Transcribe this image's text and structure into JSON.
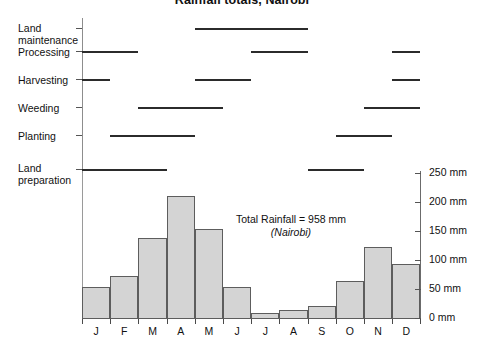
{
  "figure": {
    "title": "Rainfall totals, Nairobi"
  },
  "gantt": {
    "tasks": [
      {
        "label": "Land\nmaintenance",
        "periods": [
          {
            "start_month": 5,
            "end_month": 8
          }
        ]
      },
      {
        "label": "Processing",
        "periods": [
          {
            "start_month": 1,
            "end_month": 2
          },
          {
            "start_month": 7,
            "end_month": 8
          },
          {
            "start_month": 12,
            "end_month": 12
          }
        ]
      },
      {
        "label": "Harvesting",
        "periods": [
          {
            "start_month": 1,
            "end_month": 1
          },
          {
            "start_month": 5,
            "end_month": 6
          },
          {
            "start_month": 12,
            "end_month": 12
          }
        ]
      },
      {
        "label": "Weeding",
        "periods": [
          {
            "start_month": 3,
            "end_month": 5
          },
          {
            "start_month": 11,
            "end_month": 12
          }
        ]
      },
      {
        "label": "Planting",
        "periods": [
          {
            "start_month": 2,
            "end_month": 4
          },
          {
            "start_month": 10,
            "end_month": 11
          }
        ]
      },
      {
        "label": "Land\npreparation",
        "periods": [
          {
            "start_month": 1,
            "end_month": 3
          },
          {
            "start_month": 9,
            "end_month": 10
          }
        ]
      }
    ]
  },
  "chart_data": {
    "type": "bar",
    "title": "Rainfall totals, Nairobi",
    "xlabel": "",
    "ylabel": "",
    "categories": [
      "J",
      "F",
      "M",
      "A",
      "M",
      "J",
      "J",
      "A",
      "S",
      "O",
      "N",
      "D"
    ],
    "values": [
      55,
      75,
      140,
      212,
      155,
      55,
      10,
      15,
      22,
      65,
      125,
      95
    ],
    "units": "mm",
    "ylim": [
      0,
      250
    ],
    "ytick_values": [
      0,
      50,
      100,
      150,
      200,
      250
    ],
    "ytick_labels": [
      "0 mm",
      "50 mm",
      "100 mm",
      "150 mm",
      "200 mm",
      "250 mm"
    ],
    "grid": false,
    "legend": null,
    "bar_color": "#d4d4d4",
    "bar_edge_color": "#5d5d5d",
    "annotations": [
      {
        "text": "Total Rainfall = 958 mm",
        "sub": "(Nairobi)"
      }
    ]
  },
  "annotation": {
    "total": "Total Rainfall = 958 mm",
    "location": "(Nairobi)"
  },
  "colors": {
    "bar_fill": "#d4d4d4",
    "bar_edge": "#5d5d5d",
    "gantt_bar": "#2b2b2b",
    "axis": "#4a4a4a",
    "text": "#111111"
  }
}
